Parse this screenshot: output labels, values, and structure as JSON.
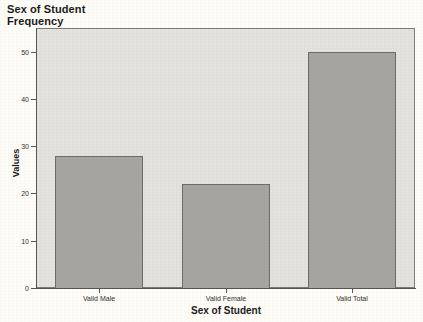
{
  "chart_data": {
    "type": "bar",
    "title": "Sex of Student\nFrequency",
    "title_line1": "Sex of Student",
    "title_line2": "Frequency",
    "categories": [
      "Valid Male",
      "Valid Female",
      "Valid Total"
    ],
    "values": [
      28,
      22,
      50
    ],
    "xlabel": "Sex of Student",
    "ylabel": "Values",
    "ylim": [
      0,
      55
    ],
    "yticks": [
      0,
      10,
      20,
      30,
      40,
      50
    ],
    "ytick_labels": [
      "0",
      "10",
      "20",
      "30",
      "40",
      "50"
    ],
    "grid": false,
    "legend": null,
    "bar_color": "#a6a5a0",
    "bar_edge_color": "#6e6c66",
    "plot_background": "#e4e2de",
    "page_background": "#fdfcf7",
    "axis_color": "#58564f"
  }
}
